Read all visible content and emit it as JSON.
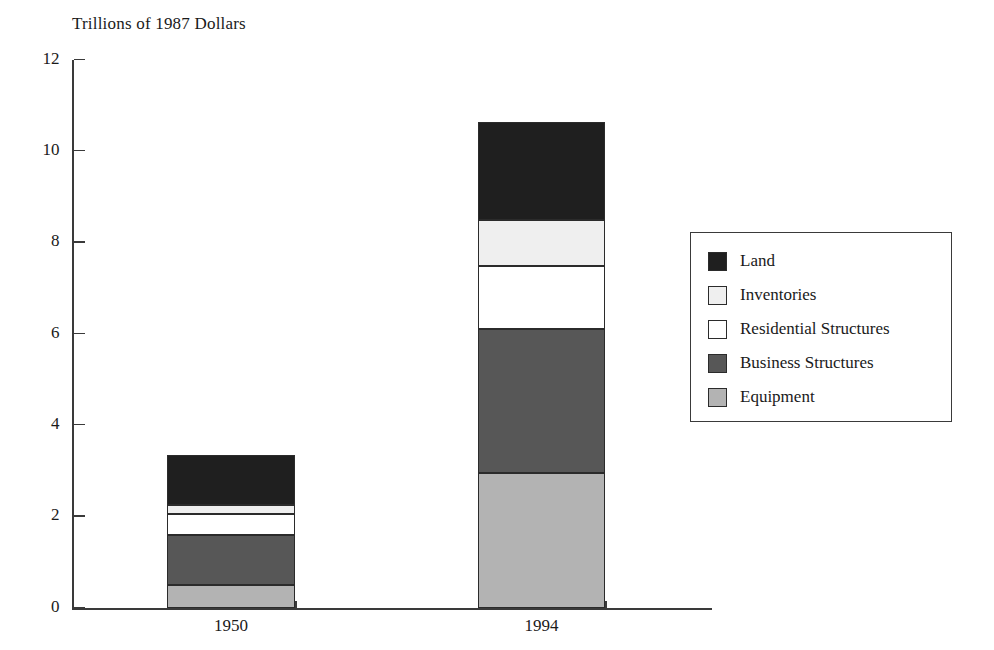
{
  "chart_data": {
    "type": "bar",
    "subtype": "stacked",
    "title": "Trillions of 1987 Dollars",
    "xlabel": "",
    "ylabel": "",
    "ylim": [
      0,
      12
    ],
    "yticks": [
      0,
      2,
      4,
      6,
      8,
      10,
      12
    ],
    "ytick_labels": [
      "0",
      "2",
      "4",
      "6",
      "8",
      "10",
      "12"
    ],
    "grid": false,
    "legend_position": "right",
    "categories": [
      "1950",
      "1994"
    ],
    "series": [
      {
        "name": "Equipment",
        "values": [
          0.5,
          2.95
        ],
        "color": "#b3b3b3"
      },
      {
        "name": "Business Structures",
        "values": [
          1.1,
          3.15
        ],
        "color": "#575757"
      },
      {
        "name": "Residential Structures",
        "values": [
          0.45,
          1.4
        ],
        "color": "#ffffff"
      },
      {
        "name": "Inventories",
        "values": [
          0.2,
          1.0
        ],
        "color": "#efefef"
      },
      {
        "name": "Land",
        "values": [
          1.1,
          2.15
        ],
        "color": "#1f1f1f"
      }
    ],
    "stack_totals": [
      3.35,
      10.65
    ],
    "stack_order_bottom_to_top": [
      "Equipment",
      "Business Structures",
      "Residential Structures",
      "Inventories",
      "Land"
    ],
    "legend_order_top_to_bottom": [
      "Land",
      "Inventories",
      "Residential Structures",
      "Business Structures",
      "Equipment"
    ]
  },
  "axis": {
    "y_max": 12,
    "y_min": 0
  },
  "colors": {
    "axis": "#3a3a3a",
    "text": "#1a1a1a",
    "background": "#ffffff",
    "segment_border": "#2b2b2b"
  }
}
